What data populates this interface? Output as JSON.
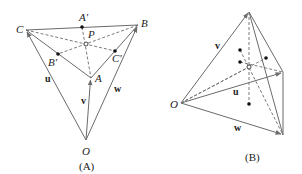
{
  "figures": [
    {
      "caption": "(A)",
      "points": {
        "C": {
          "label": "C"
        },
        "B": {
          "label": "B"
        },
        "A": {
          "label": "A"
        },
        "O": {
          "label": "O"
        },
        "A_prime": {
          "label": "A′"
        },
        "B_prime": {
          "label": "B′"
        },
        "C_prime": {
          "label": "C′"
        },
        "P": {
          "label": "P"
        }
      },
      "vectors": {
        "u": "u",
        "v": "v",
        "w": "w"
      }
    },
    {
      "caption": "(B)",
      "points": {
        "O": {
          "label": "O"
        }
      },
      "vectors": {
        "u": "u",
        "v": "v",
        "w": "w"
      }
    }
  ],
  "colors": {
    "line": "#6b6b6b",
    "text": "#222222",
    "background": "#ffffff"
  }
}
